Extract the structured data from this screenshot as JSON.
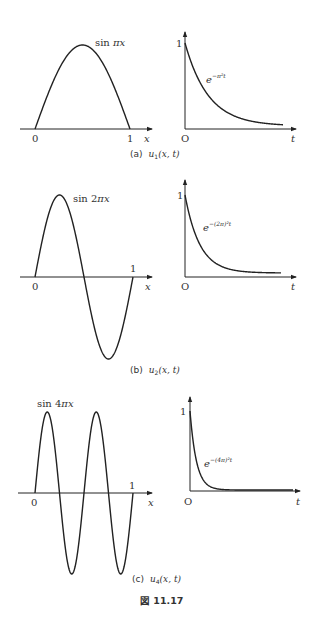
{
  "figure_title": "図 11.17",
  "chart_data": [
    {
      "type": "line",
      "panel": "(a)",
      "caption": "(a)  u₁(x, t)",
      "left": {
        "label": "sin πx",
        "x_ticks": [
          "0",
          "1"
        ],
        "xlabel": "x",
        "function": "sin(pi*x)",
        "xlim": [
          0,
          1
        ],
        "ylim": [
          0,
          1
        ]
      },
      "right": {
        "label": "e^{-π²t}",
        "y_ticks": [
          "1"
        ],
        "origin": "O",
        "xlabel": "t",
        "function": "exp(-pi^2 t)"
      }
    },
    {
      "type": "line",
      "panel": "(b)",
      "caption": "(b)  u₂(x, t)",
      "left": {
        "label": "sin 2πx",
        "x_ticks": [
          "0",
          "1"
        ],
        "xlabel": "x",
        "function": "sin(2*pi*x)",
        "xlim": [
          0,
          1
        ],
        "ylim": [
          -1,
          1
        ]
      },
      "right": {
        "label": "e^{-(2π)²t}",
        "y_ticks": [
          "1"
        ],
        "origin": "O",
        "xlabel": "t",
        "function": "exp(-(2pi)^2 t)"
      }
    },
    {
      "type": "line",
      "panel": "(c)",
      "caption": "(c)  u₄(x, t)",
      "left": {
        "label": "sin 4πx",
        "x_ticks": [
          "0",
          "1"
        ],
        "xlabel": "x",
        "function": "sin(4*pi*x)",
        "xlim": [
          0,
          1
        ],
        "ylim": [
          -1,
          1
        ]
      },
      "right": {
        "label": "e^{-(4π)²t}",
        "y_ticks": [
          "1"
        ],
        "origin": "O",
        "xlabel": "t",
        "function": "exp(-(4pi)^2 t)"
      }
    }
  ],
  "labels": {
    "a": {
      "sin_main": "sin ",
      "sin_pi": "π",
      "sin_x": "x",
      "zero": "0",
      "one": "1",
      "x": "x",
      "o": "O",
      "t": "t",
      "y1": "1",
      "exp_e": "e",
      "exp_sup": "−π²t",
      "cap_p": "(a)",
      "cap_u": "u",
      "cap_sub": "1",
      "cap_args": "(x, t)"
    },
    "b": {
      "sin_main": "sin 2",
      "sin_pi": "π",
      "sin_x": "x",
      "zero": "0",
      "one": "1",
      "x": "x",
      "o": "O",
      "t": "t",
      "y1": "1",
      "exp_e": "e",
      "exp_sup": "−(2π)²t",
      "cap_p": "(b)",
      "cap_u": "u",
      "cap_sub": "2",
      "cap_args": "(x, t)"
    },
    "c": {
      "sin_main": "sin 4",
      "sin_pi": "π",
      "sin_x": "x",
      "zero": "0",
      "one": "1",
      "x": "x",
      "o": "O",
      "t": "t",
      "y1": "1",
      "exp_e": "e",
      "exp_sup": "−(4π)²t",
      "cap_p": "(c)",
      "cap_u": "u",
      "cap_sub": "4",
      "cap_args": "(x, t)"
    }
  }
}
